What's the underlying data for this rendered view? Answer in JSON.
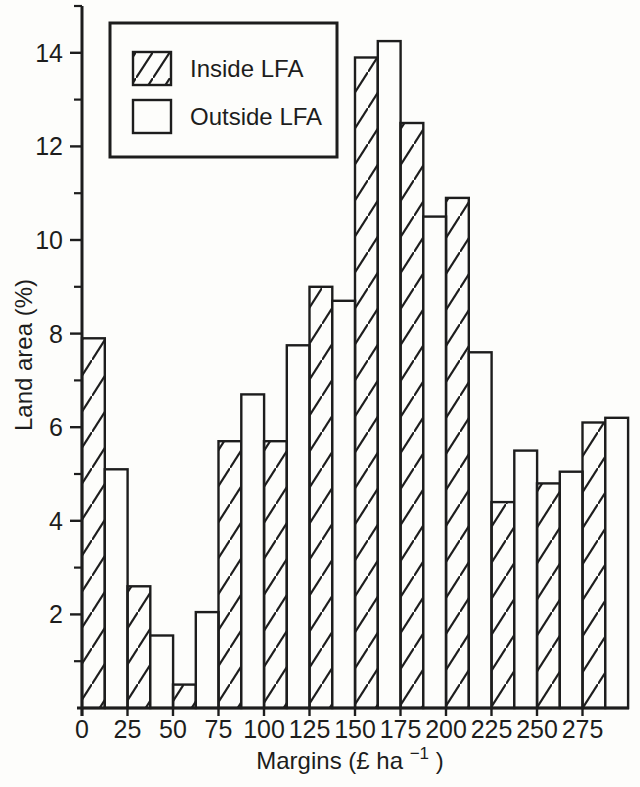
{
  "figure": {
    "background": "#fdfdfb",
    "ink": "#1d1d1d"
  },
  "chart_data": {
    "type": "bar",
    "subtype": "interleaved-histogram",
    "title": "",
    "xlabel": "Margins (£ ha⁻¹)",
    "xlabel_parts": {
      "pre": "Margins (£ ha",
      "sup": "−1",
      "post": ")"
    },
    "ylabel": "Land area (%)",
    "xlim": [
      0,
      300
    ],
    "ylim": [
      0,
      15
    ],
    "x_tick_labels": [
      "0",
      "25",
      "50",
      "75",
      "100",
      "125",
      "150",
      "175",
      "200",
      "225",
      "250",
      "275"
    ],
    "x_tick_values": [
      0,
      25,
      50,
      75,
      100,
      125,
      150,
      175,
      200,
      225,
      250,
      275
    ],
    "y_tick_labels": [
      "2",
      "4",
      "6",
      "8",
      "10",
      "12",
      "14"
    ],
    "y_tick_values": [
      2,
      4,
      6,
      8,
      10,
      12,
      14
    ],
    "y_minor_ticks": [
      1,
      3,
      5,
      7,
      9,
      11,
      13,
      15
    ],
    "bar_width": 12.5,
    "grid": false,
    "legend_position": "top-left",
    "series": [
      {
        "name": "Inside LFA",
        "fill": "hatched",
        "x_start": [
          0,
          25,
          50,
          75,
          100,
          125,
          150,
          175,
          200,
          225,
          250,
          275
        ],
        "values": [
          7.9,
          2.6,
          0.5,
          5.7,
          5.7,
          9.0,
          13.9,
          12.5,
          10.9,
          4.4,
          4.8,
          6.1
        ]
      },
      {
        "name": "Outside LFA",
        "fill": "plain",
        "x_start": [
          12.5,
          37.5,
          62.5,
          87.5,
          112.5,
          137.5,
          162.5,
          187.5,
          212.5,
          237.5,
          262.5,
          287.5
        ],
        "values": [
          5.1,
          1.55,
          2.05,
          6.7,
          7.75,
          8.7,
          14.25,
          10.5,
          7.6,
          5.5,
          5.05,
          6.2
        ]
      }
    ]
  },
  "legend": {
    "items": [
      {
        "label": "Inside LFA",
        "swatch": "hatched"
      },
      {
        "label": "Outside LFA",
        "swatch": "plain"
      }
    ]
  }
}
